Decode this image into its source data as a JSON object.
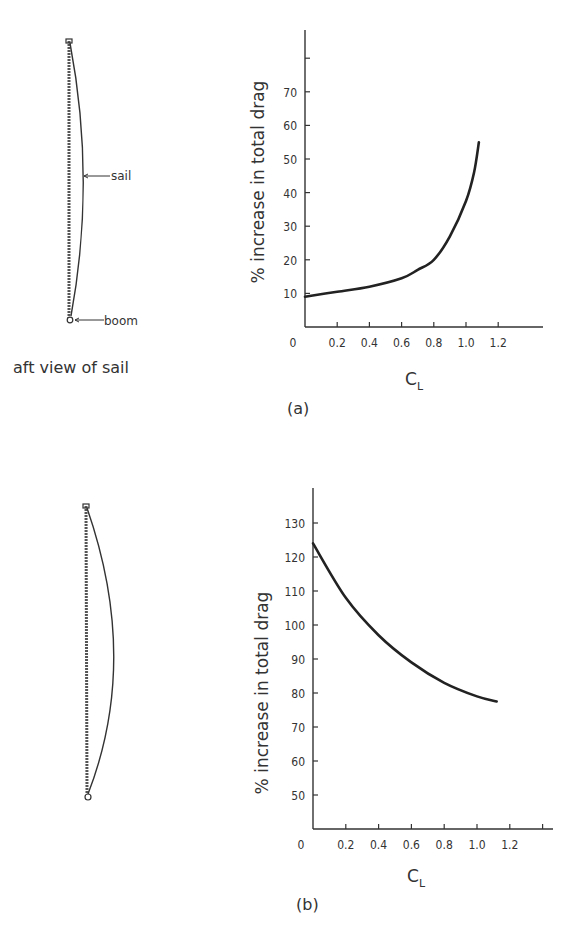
{
  "figure": {
    "panel_a": {
      "label": "(a)",
      "sketch": {
        "caption": "aft view of sail",
        "annotations": {
          "sail": "sail",
          "boom": "boom"
        }
      }
    },
    "panel_b": {
      "label": "(b)"
    }
  },
  "chart_data": [
    {
      "type": "line",
      "title": "(a)",
      "xlabel": "C_L",
      "xlabel_main": "C",
      "xlabel_sub": "L",
      "ylabel": "% increase in total drag",
      "xlim": [
        0,
        1.4
      ],
      "ylim": [
        0,
        80
      ],
      "x_ticks": [
        "0",
        "0.2",
        "0.4",
        "0.6",
        "0.8",
        "1.0",
        "1.2"
      ],
      "y_ticks": [
        "10",
        "20",
        "30",
        "40",
        "50",
        "60",
        "70"
      ],
      "grid": false,
      "legend": null,
      "series": [
        {
          "name": "drag increase",
          "x": [
            0,
            0.2,
            0.4,
            0.6,
            0.7,
            0.8,
            0.9,
            1.0,
            1.05,
            1.08
          ],
          "y": [
            9,
            10.5,
            12,
            14.5,
            17,
            20,
            27,
            37.5,
            46,
            55
          ]
        }
      ]
    },
    {
      "type": "line",
      "title": "(b)",
      "xlabel": "C_L",
      "xlabel_main": "C",
      "xlabel_sub": "L",
      "ylabel": "% increase in total drag",
      "xlim": [
        0,
        1.4
      ],
      "ylim": [
        40,
        140
      ],
      "x_ticks": [
        "0",
        "0.2",
        "0.4",
        "0.6",
        "0.8",
        "1.0",
        "1.2"
      ],
      "y_ticks": [
        "50",
        "60",
        "70",
        "80",
        "90",
        "100",
        "110",
        "120",
        "130"
      ],
      "grid": false,
      "legend": null,
      "series": [
        {
          "name": "drag increase",
          "x": [
            0,
            0.2,
            0.4,
            0.6,
            0.8,
            1.0,
            1.12
          ],
          "y": [
            124,
            108,
            97,
            89,
            83,
            79,
            77.5
          ]
        }
      ]
    }
  ]
}
